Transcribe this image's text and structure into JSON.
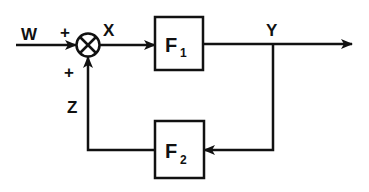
{
  "diagram": {
    "type": "feedback-block-diagram",
    "colors": {
      "ink": "#111111",
      "background": "#ffffff"
    },
    "signals": {
      "input": "W",
      "error": "X",
      "output": "Y",
      "feedback": "Z"
    },
    "junction": {
      "symbol": "⊗",
      "input_signs": {
        "top": "+",
        "bottom": "+"
      }
    },
    "blocks": [
      {
        "id": "forward",
        "name": "F",
        "subscript": "1"
      },
      {
        "id": "feedback",
        "name": "F",
        "subscript": "2"
      }
    ]
  }
}
